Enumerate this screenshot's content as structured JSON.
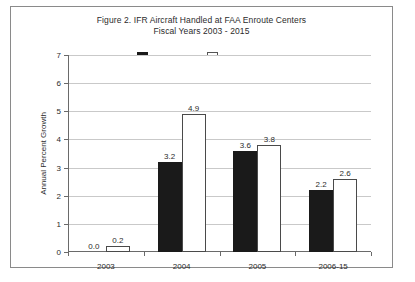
{
  "figure": {
    "title_line1": "Figure 2.  IFR Aircraft Handled at FAA Enroute Centers",
    "title_line2": "Fiscal Years 2003 - 2015"
  },
  "chart_data": {
    "type": "bar",
    "title": "Figure 2.  IFR Aircraft Handled at FAA Enroute Centers Fiscal Years 2003 - 2015",
    "xlabel": "",
    "ylabel": "Annual Percent Growth",
    "ylim": [
      0,
      7
    ],
    "ytick_labels": [
      "0",
      "1",
      "2",
      "3",
      "4",
      "5",
      "6",
      "7"
    ],
    "ytick_values": [
      0,
      1,
      2,
      3,
      4,
      5,
      6,
      7
    ],
    "grid": true,
    "legend_position": "top-center",
    "categories": [
      "2003",
      "2004",
      "2005",
      "2006-15"
    ],
    "series": [
      {
        "name": "Total",
        "color": "#1a1a1a",
        "values": [
          0.0,
          3.2,
          3.6,
          2.2
        ],
        "labels": [
          "0.0",
          "3.2",
          "3.6",
          "2.2"
        ]
      },
      {
        "name": "Commercial",
        "color": "#ffffff",
        "values": [
          0.2,
          4.9,
          3.8,
          2.6
        ],
        "labels": [
          "0.2",
          "4.9",
          "3.8",
          "2.6"
        ]
      }
    ]
  }
}
